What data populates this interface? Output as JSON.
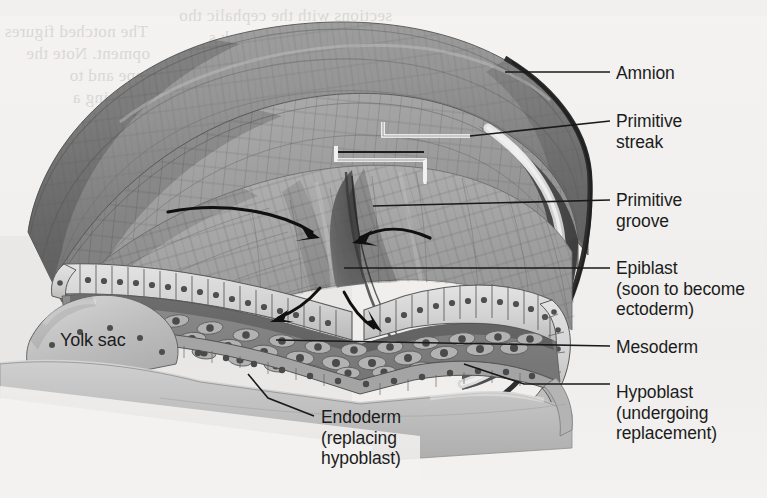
{
  "figure": {
    "type": "anatomical-illustration",
    "style": "grayscale textbook line-and-tone drawing"
  },
  "labels": {
    "amnion": "Amnion",
    "primitive_streak": "Primitive\nstreak",
    "primitive_groove": "Primitive\ngroove",
    "epiblast": "Epiblast\n(soon to become\nectoderm)",
    "mesoderm": "Mesoderm",
    "hypoblast": "Hypoblast\n(undergoing\nreplacement)",
    "endoderm": "Endoderm\n(replacing\nhypoblast)",
    "yolk_sac": "Yolk sac"
  },
  "background_text": {
    "top_left_1": "The notched figures",
    "top_left_2": "opment. Note the",
    "top_left_3": "hape and to",
    "top_left_4": "enclosing a",
    "top_right_1": "sections with the cephalic tho",
    "top_right_2": "transport in the 4-5 week s",
    "bottom_1": "vents in a organisms are",
    "bottom_2": "brain development in later chapters; develop",
    "bottom_3": "ment of the neural tube outpocketing of the throat which in turn"
  },
  "colors": {
    "page": "#f2f1ef",
    "amnion_outer": "#8d8d8d",
    "amnion_inner": "#9a9a9a",
    "epiblast_sheet": "#d2d2d2",
    "cavity_dark": "#4a4a4a",
    "mesoderm": "#9c9c9c",
    "yolk_sac": "#bdbdbd",
    "slab": "#c9c9c9",
    "label_text": "#1c1c1c",
    "leader_line": "#1a1a1a",
    "bracket_white": "#ffffff",
    "arrow": "#101010"
  },
  "annotations": {
    "arrow_count_upper": 2,
    "arrow_count_lower": 2,
    "arrow_meaning": "epiblast cells migrating into and through the primitive groove to form mesoderm and endoderm",
    "bracket_meaning": "extent of the primitive streak"
  }
}
